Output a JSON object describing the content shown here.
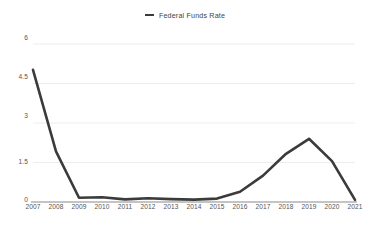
{
  "legend": {
    "entries": [
      {
        "label": "Federal Funds Rate",
        "color": "#3b3b3b",
        "marker": "line-swatch"
      }
    ]
  },
  "axes": {
    "y_ticks": [
      "6",
      "4.5",
      "3",
      "1.5",
      "0"
    ],
    "x_ticks": [
      "2007",
      "2008",
      "2009",
      "2010",
      "2011",
      "2012",
      "2013",
      "2014",
      "2015",
      "2016",
      "2017",
      "2018",
      "2019",
      "2020",
      "2021"
    ]
  },
  "chart_data": {
    "type": "line",
    "title": "",
    "subtitle": "",
    "xlabel": "",
    "ylabel": "",
    "xlim": [
      2007,
      2021
    ],
    "ylim": [
      0,
      6
    ],
    "ytick_values": [
      0,
      1.5,
      3,
      4.5,
      6
    ],
    "grid": true,
    "grid_axis": "y",
    "legend_position": "top-center",
    "x": [
      2007,
      2008,
      2009,
      2010,
      2011,
      2012,
      2013,
      2014,
      2015,
      2016,
      2017,
      2018,
      2019,
      2020,
      2021
    ],
    "categories": [
      "2007",
      "2008",
      "2009",
      "2010",
      "2011",
      "2012",
      "2013",
      "2014",
      "2015",
      "2016",
      "2017",
      "2018",
      "2019",
      "2020",
      "2021"
    ],
    "series": [
      {
        "name": "Federal Funds Rate",
        "color": "#3b3b3b",
        "line_width": 2.6,
        "values": [
          5.02,
          1.92,
          0.16,
          0.18,
          0.1,
          0.14,
          0.11,
          0.09,
          0.13,
          0.39,
          1.0,
          1.83,
          2.4,
          1.55,
          0.08
        ]
      }
    ]
  },
  "colors": {
    "line": "#3b3b3b",
    "grid": "#ededed",
    "axis": "#8a8a8a",
    "tick_text": "#555555",
    "legend_text": "#444444",
    "background": "#ffffff"
  }
}
